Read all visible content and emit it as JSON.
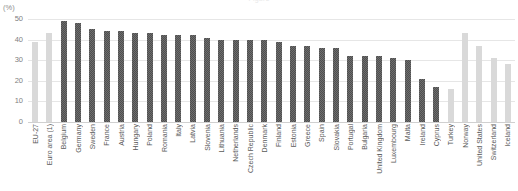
{
  "chart_data": {
    "type": "bar",
    "title": "",
    "unit_label": "(%)",
    "xlabel": "",
    "ylabel": "",
    "ylim": [
      0,
      50
    ],
    "yticks": [
      0,
      10,
      20,
      30,
      40,
      50
    ],
    "grid": true,
    "legend": "none",
    "series_name": "Share",
    "categories": [
      "EU-27",
      "Euro area (1)",
      "Belgium",
      "Germany",
      "Sweden",
      "France",
      "Austria",
      "Hungary",
      "Poland",
      "Romania",
      "Italy",
      "Latvia",
      "Slovenia",
      "Lithuania",
      "Netherlands",
      "Czech Republic",
      "Denmark",
      "Finland",
      "Estonia",
      "Greece",
      "Spain",
      "Slovakia",
      "Portugal",
      "Bulgaria",
      "United Kingdom",
      "Luxembourg",
      "Malta",
      "Ireland",
      "Cyprus",
      "Turkey",
      "Norway",
      "United States",
      "Switzerland",
      "Iceland"
    ],
    "values": [
      39,
      43,
      49,
      48,
      45,
      44,
      44,
      43,
      43,
      42,
      42,
      42,
      41,
      40,
      40,
      40,
      40,
      39,
      37,
      37,
      36,
      36,
      32,
      32,
      32,
      31,
      30,
      21,
      17,
      16,
      43,
      37,
      31,
      28
    ],
    "bar_styles": [
      "light",
      "light",
      "dark",
      "dark",
      "dark",
      "dark",
      "dark",
      "dark",
      "dark",
      "dark",
      "dark",
      "dark",
      "dark",
      "dark",
      "dark",
      "dark",
      "dark",
      "dark",
      "dark",
      "dark",
      "dark",
      "dark",
      "dark",
      "dark",
      "dark",
      "dark",
      "dark",
      "dark",
      "dark",
      "light",
      "light",
      "light",
      "light",
      "light"
    ],
    "colors": {
      "bar_light": "#d9d9d9",
      "bar_dark": "#595959",
      "gridline": "#e6e6e6",
      "text": "#595959",
      "tick_text": "#808080"
    }
  },
  "header": {
    "cutoff_title": "Figure"
  }
}
